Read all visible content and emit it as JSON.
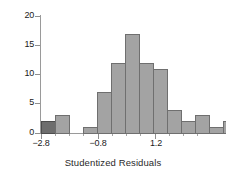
{
  "chart_data": {
    "type": "bar",
    "title": "",
    "subtitle": "",
    "xlabel": "Studentized Residuals",
    "ylabel": "",
    "grid": false,
    "legend": "none",
    "bin_width": 0.4,
    "bin_starts": [
      -3.0,
      -2.6,
      -2.2,
      -1.8,
      -1.4,
      -1.0,
      -0.6,
      -0.2,
      0.2,
      0.6,
      1.0,
      1.4,
      1.8,
      2.2
    ],
    "categories": [
      "-3.0",
      "-2.6",
      "-2.2",
      "-1.8",
      "-1.4",
      "-1.0",
      "-0.6",
      "-0.2",
      "0.2",
      "0.6",
      "1.0",
      "1.4",
      "1.8",
      "2.2"
    ],
    "values": [
      2,
      3,
      0,
      1,
      7,
      12,
      17,
      12,
      11,
      4,
      2,
      3,
      1,
      2
    ],
    "highlight_index": 0,
    "xlim": [
      -3.0,
      3.0
    ],
    "ylim": [
      0,
      20
    ],
    "xticks": [
      -2.8,
      -0.8,
      1.2
    ],
    "xtick_labels": [
      "−2.8",
      "−0.8",
      "1.2"
    ],
    "yticks": [
      0,
      5,
      10,
      15,
      20
    ],
    "ytick_labels": [
      "0",
      "5",
      "10",
      "15",
      "20"
    ],
    "colors": {
      "bar_fill": "#a3a3a3",
      "bar_edge": "#6f6f6f",
      "bar_highlight_fill": "#6e6e6e",
      "bar_highlight_edge": "#4d4d4d",
      "axis": "#9a9a9a",
      "text": "#1a1a1a",
      "background": "#ffffff"
    }
  },
  "axis": {
    "y_labels": [
      "20",
      "15",
      "10",
      "5",
      "0"
    ],
    "x_labels": [
      "−2.8",
      "−0.8",
      "1.2"
    ],
    "x_title": "Studentized Residuals"
  }
}
